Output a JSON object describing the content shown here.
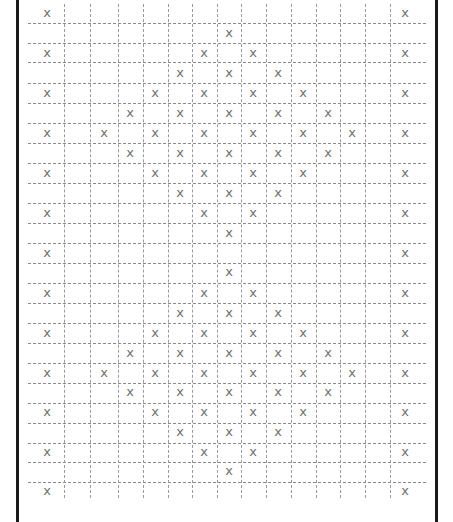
{
  "pattern": {
    "mark_glyph": "x",
    "colors": {
      "border": "#1a1a1a",
      "grid": "#8a8a8a",
      "mark": "#707070",
      "background": "#ffffff"
    },
    "column_centers": [
      47,
      77,
      104,
      130,
      155,
      180,
      204,
      229,
      253,
      278,
      303,
      328,
      352,
      377,
      405
    ],
    "row_centers": [
      14,
      34,
      54,
      74,
      94,
      114,
      134,
      154,
      174,
      194,
      214,
      234,
      254,
      273,
      294,
      314,
      334,
      354,
      374,
      393,
      413,
      433,
      453,
      472,
      492
    ],
    "vertical_lines": [
      64,
      90,
      118,
      143,
      168,
      192,
      217,
      241,
      266,
      291,
      316,
      340,
      365,
      390
    ],
    "horizontal_lines": [
      23,
      43,
      62,
      83,
      103,
      123,
      143,
      163,
      183,
      203,
      223,
      243,
      263,
      283,
      303,
      323,
      343,
      363,
      383,
      403,
      423,
      443,
      462,
      482
    ],
    "rows": [
      [
        0,
        14
      ],
      [
        7
      ],
      [
        0,
        6,
        8,
        14
      ],
      [
        5,
        7,
        9
      ],
      [
        0,
        4,
        6,
        8,
        10,
        14
      ],
      [
        3,
        5,
        7,
        9,
        11
      ],
      [
        0,
        2,
        4,
        6,
        8,
        10,
        12,
        14
      ],
      [
        3,
        5,
        7,
        9,
        11
      ],
      [
        0,
        4,
        6,
        8,
        10,
        14
      ],
      [
        5,
        7,
        9
      ],
      [
        0,
        6,
        8,
        14
      ],
      [
        7
      ],
      [
        0,
        14
      ],
      [
        7
      ],
      [
        0,
        6,
        8,
        14
      ],
      [
        5,
        7,
        9
      ],
      [
        0,
        4,
        6,
        8,
        10,
        14
      ],
      [
        3,
        5,
        7,
        9,
        11
      ],
      [
        0,
        2,
        4,
        6,
        8,
        10,
        12,
        14
      ],
      [
        3,
        5,
        7,
        9,
        11
      ],
      [
        0,
        4,
        6,
        8,
        10,
        14
      ],
      [
        5,
        7,
        9
      ],
      [
        0,
        6,
        8,
        14
      ],
      [
        7
      ],
      [
        0,
        14
      ]
    ]
  }
}
